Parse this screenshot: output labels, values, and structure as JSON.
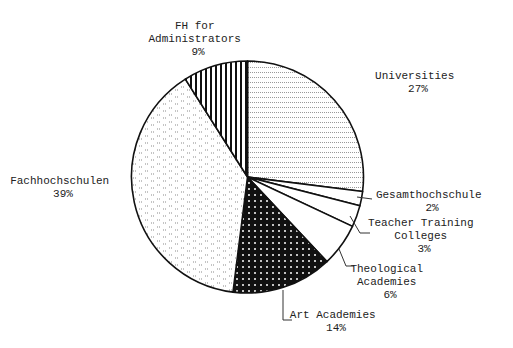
{
  "chart_data": {
    "type": "pie",
    "title": "",
    "start_angle_deg": 0,
    "direction": "clockwise",
    "categories": [
      "Universities",
      "Gesamthochschule",
      "Teacher Training Colleges",
      "Theological Academies",
      "Art Academies",
      "Fachhochschulen",
      "FH for Administrators"
    ],
    "values": [
      27,
      2,
      3,
      6,
      14,
      39,
      9
    ],
    "unit": "%",
    "slices": [
      {
        "name": "Universities",
        "value": 27,
        "pattern": "horizontal-dotted-lines",
        "label_lines": [
          "Universities",
          "27%"
        ]
      },
      {
        "name": "Gesamthochschule",
        "value": 2,
        "pattern": "white",
        "label_lines": [
          "Gesamthochschule",
          "2%"
        ]
      },
      {
        "name": "Teacher Training Colleges",
        "value": 3,
        "pattern": "white",
        "label_lines": [
          "Teacher Training",
          "Colleges",
          "3%"
        ]
      },
      {
        "name": "Theological Academies",
        "value": 6,
        "pattern": "white",
        "label_lines": [
          "Theological",
          "Academies",
          "6%"
        ]
      },
      {
        "name": "Art Academies",
        "value": 14,
        "pattern": "black-with-white-dots",
        "label_lines": [
          "Art Academies",
          "14%"
        ]
      },
      {
        "name": "Fachhochschulen",
        "value": 39,
        "pattern": "light-dashes",
        "label_lines": [
          "Fachhochschulen",
          "39%"
        ]
      },
      {
        "name": "FH for Administrators",
        "value": 9,
        "pattern": "vertical-stripes",
        "label_lines": [
          "FH for",
          "Administrators",
          "9%"
        ]
      }
    ],
    "legend": "none (labels placed beside slices)"
  },
  "colors": {
    "stroke": "#111111",
    "background": "#ffffff",
    "text": "#222222"
  }
}
